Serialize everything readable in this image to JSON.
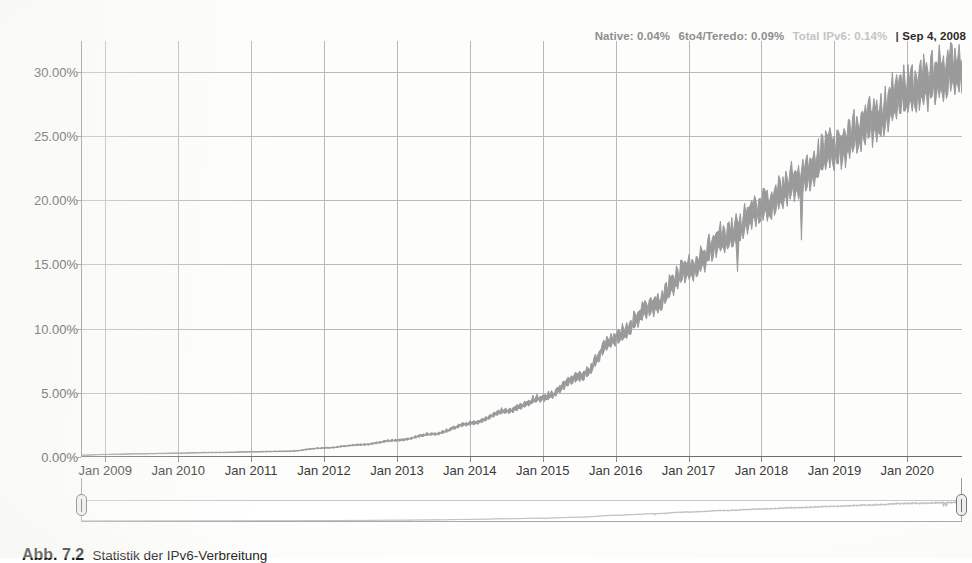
{
  "legend": {
    "native_label": "Native:",
    "native_value": "0.04%",
    "sixtofour_label": "6to4/Teredo:",
    "sixtofour_value": "0.09%",
    "total_label": "Total IPv6:",
    "total_value": "0.14%",
    "separator": "|",
    "date": "Sep 4, 2008",
    "native_color": "#8e8e8e",
    "total_color": "#c4c4c4",
    "date_color": "#2b2b2b"
  },
  "axes": {
    "y_ticks": [
      "0.00%",
      "5.00%",
      "10.00%",
      "15.00%",
      "20.00%",
      "25.00%",
      "30.00%"
    ],
    "y_values": [
      0,
      5,
      10,
      15,
      20,
      25,
      30
    ],
    "y_min": 0,
    "y_max": 32.4,
    "x_ticks": [
      "Jan 2009",
      "Jan 2010",
      "Jan 2011",
      "Jan 2012",
      "Jan 2013",
      "Jan 2014",
      "Jan 2015",
      "Jan 2016",
      "Jan 2017",
      "Jan 2018",
      "Jan 2019",
      "Jan 2020"
    ],
    "x_min": "Sep 2008",
    "x_max": "Sep 2020"
  },
  "navigator": {
    "left_handle": "navigator-left-handle",
    "right_handle": "navigator-right-handle",
    "range_start": "Sep 2008",
    "range_end": "Sep 2020"
  },
  "caption": {
    "label": "Abb. 7.2",
    "text": "Statistik der IPv6-Verbreitung"
  },
  "chart_data": {
    "type": "area",
    "title": "",
    "subtitle": "",
    "xlabel": "",
    "ylabel": "",
    "ylim": [
      0,
      32.4
    ],
    "grid": true,
    "legend_position": "top-right",
    "series_color": "#9a9a9a",
    "series": [
      {
        "name": "Total IPv6 adoption",
        "unit": "%",
        "x": [
          "2008-09",
          "2009-01",
          "2009-07",
          "2010-01",
          "2010-07",
          "2011-01",
          "2011-07",
          "2012-01",
          "2012-07",
          "2013-01",
          "2013-07",
          "2014-01",
          "2014-07",
          "2015-01",
          "2015-07",
          "2016-01",
          "2016-07",
          "2017-01",
          "2017-07",
          "2018-01",
          "2018-07",
          "2019-01",
          "2019-07",
          "2020-01",
          "2020-07",
          "2020-09"
        ],
        "values": [
          0.14,
          0.2,
          0.25,
          0.3,
          0.35,
          0.4,
          0.45,
          0.7,
          0.95,
          1.3,
          1.8,
          2.6,
          3.6,
          4.6,
          6.2,
          9.3,
          11.7,
          14.6,
          17.0,
          19.5,
          21.5,
          24.0,
          26.0,
          28.5,
          29.5,
          30.3
        ]
      }
    ],
    "annotations": [
      {
        "text": "Native: 0.04%",
        "x": "2008-09"
      },
      {
        "text": "6to4/Teredo: 0.09%",
        "x": "2008-09"
      },
      {
        "text": "Total IPv6: 0.14%",
        "x": "2008-09"
      }
    ]
  }
}
